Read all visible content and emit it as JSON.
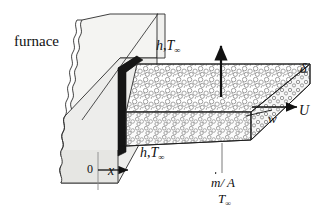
{
  "figure": {
    "title_label": "furnace",
    "labels": {
      "furnace": "furnace",
      "convection_top_h": "h",
      "convection_top_T": "T",
      "convection_bottom_h": "h",
      "convection_bottom_T": "T",
      "comma": ",",
      "infinity_subscript": "∞",
      "thickness": "δ",
      "width": "w",
      "velocity": "U",
      "axis_x": "x",
      "origin": "0",
      "mass_flux_numerator": "m",
      "mass_flux_rest": "/ A",
      "ambient_temperature": "T"
    },
    "colors": {
      "ink": "#111111",
      "wall_face_light": "#ededeb",
      "wall_face_mid": "#e2e2df",
      "wall_top": "#f4f4f2",
      "slot_dark": "#1a1a1a",
      "sheet_texture": "#9a9a9a",
      "background": "#ffffff"
    },
    "geometry": {
      "sheet_thickness_label": "δ",
      "sheet_width_label": "w",
      "sheet_velocity_label": "U"
    }
  }
}
